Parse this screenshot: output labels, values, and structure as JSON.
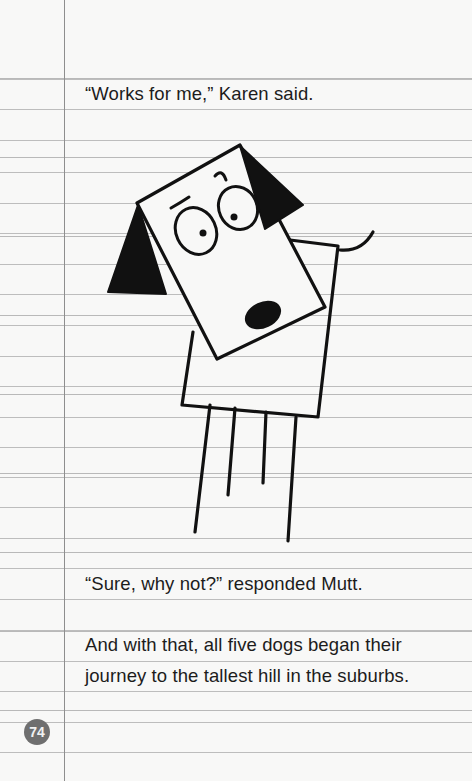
{
  "page": {
    "lines": [
      "“Works for me,” Karen said.",
      "“Sure, why not?” responded Mutt.",
      "And with that, all five dogs began their",
      "journey to the tallest hill in the suburbs."
    ],
    "page_number": "74"
  },
  "illustration": {
    "subject": "square-headed cartoon dog with black ears, surprised face, tilted head",
    "colors": {
      "ink": "#111111",
      "paper": "#f8f8f7",
      "rule": "#bdbdbd",
      "margin": "#8e8e8e",
      "badge": "#6f6f6f"
    }
  }
}
